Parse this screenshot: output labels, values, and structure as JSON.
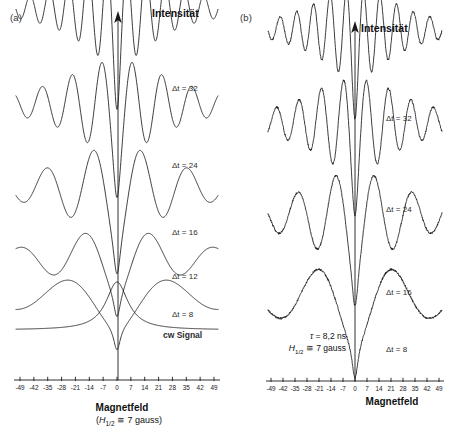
{
  "figure": {
    "panel_a_label": "(a)",
    "panel_b_label": "(b)",
    "y_axis_label": "Intensität",
    "x_axis_label": "Magnetfeld",
    "x_axis_sublabel_a": "(H1/2 ≅ 7 gauss)",
    "cw_label": "cw Signal"
  },
  "panel_a": {
    "trace_labels": [
      "Δt = 32",
      "Δt = 24",
      "Δt = 16",
      "Δt = 12",
      "Δt = 8"
    ],
    "cw_signal_label": "cw Signal"
  },
  "panel_b": {
    "trace_labels": [
      "Δt = 32",
      "Δt = 24",
      "Δt = 16",
      "Δt = 8"
    ],
    "annotation_tau": "τ = 8,2 ns",
    "annotation_h": "H1/2 ≅ 7 gauss"
  },
  "colors": {
    "curve": "#1a1a1a",
    "axis": "#1a1a1a",
    "background": "#ffffff"
  },
  "chart_data": {
    "type": "line",
    "title": "",
    "xlabel": "Magnetfeld",
    "ylabel": "Intensität",
    "grid": false,
    "legend": "inline-right-labels",
    "x_tick_labels": [
      "-49",
      "-42",
      "-35",
      "-28",
      "-21",
      "-14",
      "-7",
      "0",
      "7",
      "14",
      "21",
      "28",
      "35",
      "42",
      "49"
    ],
    "x_tick_values": [
      -49,
      -42,
      -35,
      -28,
      -21,
      -14,
      -7,
      0,
      7,
      14,
      21,
      28,
      35,
      42,
      49
    ],
    "xlim": [
      -53,
      53
    ],
    "panels": [
      {
        "name": "(a)",
        "kind": "theory",
        "note": "smooth calculated quantum-beat level-crossing curves",
        "series": [
          {
            "name": "Δt = 32",
            "delta_t": 32,
            "beat_frequency": 0.62,
            "envelope_width": 26,
            "amplitude": 1.0,
            "baseline_y": 60
          },
          {
            "name": "Δt = 24",
            "delta_t": 24,
            "beat_frequency": 0.4,
            "envelope_width": 30,
            "amplitude": 1.0,
            "baseline_y": 152
          },
          {
            "name": "Δt = 16",
            "delta_t": 16,
            "beat_frequency": 0.255,
            "envelope_width": 34,
            "amplitude": 1.0,
            "baseline_y": 232
          },
          {
            "name": "Δt = 12",
            "delta_t": 12,
            "beat_frequency": 0.185,
            "envelope_width": 38,
            "amplitude": 1.0,
            "baseline_y": 288
          },
          {
            "name": "Δt = 8",
            "delta_t": 8,
            "beat_frequency": 0.115,
            "envelope_width": 44,
            "amplitude": 1.0,
            "baseline_y": 325
          },
          {
            "name": "cw Signal",
            "delta_t": null,
            "beat_frequency": 0.0,
            "envelope_width": 10,
            "amplitude": 1.0,
            "baseline_y": 330
          }
        ]
      },
      {
        "name": "(b)",
        "kind": "experiment",
        "note": "measured noisy traces, lifetime tau = 8,2 ns, H_1/2 = 7 gauss",
        "tau_ns": 8.2,
        "h_half_gauss": 7,
        "series": [
          {
            "name": "Δt = 32",
            "delta_t": 32,
            "beat_frequency": 0.62,
            "envelope_width": 28,
            "amplitude": 1.0,
            "baseline_y": 75
          },
          {
            "name": "Δt = 24",
            "delta_t": 24,
            "beat_frequency": 0.46,
            "envelope_width": 32,
            "amplitude": 1.0,
            "baseline_y": 170
          },
          {
            "name": "Δt = 16",
            "delta_t": 16,
            "beat_frequency": 0.27,
            "envelope_width": 36,
            "amplitude": 1.0,
            "baseline_y": 262
          },
          {
            "name": "Δt = 8",
            "delta_t": 8,
            "beat_frequency": 0.135,
            "envelope_width": 42,
            "amplitude": 1.0,
            "baseline_y": 340
          }
        ]
      }
    ]
  }
}
